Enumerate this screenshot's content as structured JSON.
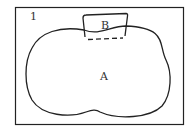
{
  "diagram": {
    "frame_label": "1",
    "region_a_label": "A",
    "region_b_label": "B",
    "stroke_color": "#222222",
    "background": "#ffffff"
  }
}
